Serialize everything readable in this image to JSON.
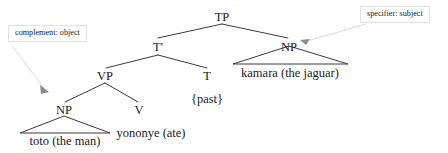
{
  "diagram": {
    "type": "syntax-tree",
    "title": "",
    "language_example": "toto yononye kamara",
    "nodes": {
      "tp": "TP",
      "tbar": "T'",
      "np_object": "NP",
      "np_subject": "NP",
      "vp": "VP",
      "v": "V",
      "t": "T"
    },
    "terminals": {
      "object_words": "toto (the man)",
      "verb_words": "yononye (ate)",
      "tense_words": "{past}",
      "subject_words": "kamara (the jaguar)"
    },
    "callouts": {
      "complement": "complement: object",
      "specifier": "specifier: subject"
    }
  },
  "colors": {
    "line": "#3b3b3b",
    "text": "#1a1a1a",
    "callout_border": "#e2e2e6",
    "leader_line": "#d8d8dc",
    "arrowhead": "#8a8a90",
    "background": "#ffffff"
  }
}
